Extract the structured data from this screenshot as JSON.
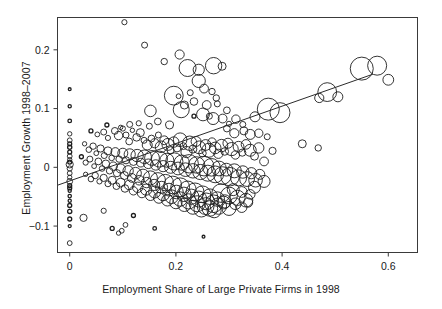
{
  "figure": {
    "background": "#ffffff",
    "ink": "#1a1a1a",
    "width": 442,
    "height": 309
  },
  "chart_data": {
    "type": "scatter",
    "title": "",
    "xlabel": "Employment Share of Large Private Firms in 1998",
    "ylabel": "Employment Growth 1998–2007",
    "marker": "open-circle",
    "marker_size_encodes": "weight",
    "grid": false,
    "legend": null,
    "xlim": [
      -0.023,
      0.655
    ],
    "ylim": [
      -0.145,
      0.255
    ],
    "xticks": [
      0,
      0.2,
      0.4,
      0.6
    ],
    "xtick_labels": [
      "0",
      "0.2",
      "0.4",
      "0.6"
    ],
    "yticks": [
      -0.1,
      0,
      0.1,
      0.2
    ],
    "ytick_labels": [
      "-0.1",
      "0",
      "0.1",
      "0.2"
    ],
    "fit_line": {
      "type": "linear",
      "x0": -0.023,
      "y0": -0.0305,
      "x1": 0.571,
      "y1": 0.1585,
      "slope": 0.318,
      "intercept": -0.0232
    },
    "points": [
      [
        0.0,
        0.104,
        1.6
      ],
      [
        0.0,
        0.079,
        1.8
      ],
      [
        0.0,
        0.057,
        2.2
      ],
      [
        0.0,
        0.046,
        2.4
      ],
      [
        0.0,
        0.04,
        2.0
      ],
      [
        0.0,
        0.034,
        2.1
      ],
      [
        0.0,
        0.026,
        2.0
      ],
      [
        0.0,
        0.019,
        2.4
      ],
      [
        0.0,
        0.013,
        2.2
      ],
      [
        0.0,
        0.005,
        3.6
      ],
      [
        0.0,
        -0.002,
        2.6
      ],
      [
        0.0,
        -0.01,
        2.4
      ],
      [
        0.0,
        -0.017,
        2.2
      ],
      [
        0.0,
        -0.024,
        2.9
      ],
      [
        0.0,
        -0.031,
        2.0
      ],
      [
        0.0,
        -0.04,
        1.6
      ],
      [
        0.0,
        -0.049,
        1.7
      ],
      [
        0.0,
        -0.057,
        1.6
      ],
      [
        0.0,
        -0.065,
        2.0
      ],
      [
        0.0,
        -0.075,
        2.1
      ],
      [
        0.0,
        -0.088,
        2.0
      ],
      [
        0.0,
        -0.1,
        1.5
      ],
      [
        0.0,
        -0.129,
        2.4
      ],
      [
        0.0,
        0.133,
        1.4
      ],
      [
        0.0,
        0.009,
        2.0
      ],
      [
        0.0,
        -0.035,
        2.0
      ],
      [
        0.103,
        0.247,
        2.6
      ],
      [
        0.141,
        0.208,
        3.0
      ],
      [
        0.178,
        0.18,
        3.2
      ],
      [
        0.207,
        0.192,
        4.6
      ],
      [
        0.222,
        0.169,
        8.5
      ],
      [
        0.243,
        0.166,
        5.6
      ],
      [
        0.271,
        0.173,
        8.2
      ],
      [
        0.287,
        0.172,
        4.0
      ],
      [
        0.243,
        0.147,
        6.6
      ],
      [
        0.253,
        0.134,
        4.4
      ],
      [
        0.268,
        0.129,
        3.2
      ],
      [
        0.276,
        0.118,
        3.2
      ],
      [
        0.278,
        0.108,
        3.0
      ],
      [
        0.227,
        0.127,
        3.0
      ],
      [
        0.196,
        0.122,
        9.4
      ],
      [
        0.205,
        0.121,
        2.4
      ],
      [
        0.152,
        0.096,
        5.8
      ],
      [
        0.21,
        0.098,
        8.0
      ],
      [
        0.234,
        0.087,
        2.0
      ],
      [
        0.251,
        0.09,
        6.4
      ],
      [
        0.263,
        0.087,
        3.0
      ],
      [
        0.27,
        0.083,
        6.0
      ],
      [
        0.288,
        0.083,
        4.4
      ],
      [
        0.296,
        0.097,
        3.4
      ],
      [
        0.3,
        0.074,
        2.6
      ],
      [
        0.313,
        0.082,
        4.2
      ],
      [
        0.326,
        0.073,
        3.0
      ],
      [
        0.349,
        0.086,
        5.0
      ],
      [
        0.374,
        0.099,
        11.0
      ],
      [
        0.396,
        0.093,
        10.0
      ],
      [
        0.47,
        0.118,
        4.6
      ],
      [
        0.485,
        0.128,
        9.4
      ],
      [
        0.505,
        0.12,
        5.0
      ],
      [
        0.55,
        0.168,
        11.5
      ],
      [
        0.579,
        0.173,
        9.5
      ],
      [
        0.6,
        0.149,
        5.4
      ],
      [
        0.438,
        0.04,
        4.0
      ],
      [
        0.468,
        0.033,
        3.2
      ],
      [
        0.04,
        0.062,
        2.0
      ],
      [
        0.052,
        0.056,
        2.4
      ],
      [
        0.064,
        0.06,
        3.0
      ],
      [
        0.072,
        0.05,
        2.6
      ],
      [
        0.085,
        0.062,
        3.4
      ],
      [
        0.092,
        0.054,
        4.2
      ],
      [
        0.1,
        0.066,
        2.6
      ],
      [
        0.106,
        0.055,
        3.0
      ],
      [
        0.112,
        0.044,
        3.4
      ],
      [
        0.118,
        0.063,
        2.2
      ],
      [
        0.126,
        0.051,
        3.8
      ],
      [
        0.133,
        0.059,
        4.0
      ],
      [
        0.14,
        0.046,
        3.0
      ],
      [
        0.146,
        0.038,
        5.0
      ],
      [
        0.154,
        0.049,
        3.4
      ],
      [
        0.16,
        0.041,
        4.6
      ],
      [
        0.167,
        0.055,
        3.0
      ],
      [
        0.172,
        0.035,
        5.8
      ],
      [
        0.178,
        0.046,
        4.4
      ],
      [
        0.185,
        0.039,
        6.0
      ],
      [
        0.19,
        0.029,
        3.6
      ],
      [
        0.196,
        0.043,
        5.2
      ],
      [
        0.202,
        0.033,
        4.0
      ],
      [
        0.208,
        0.047,
        6.8
      ],
      [
        0.214,
        0.036,
        3.4
      ],
      [
        0.22,
        0.026,
        5.6
      ],
      [
        0.226,
        0.041,
        7.2
      ],
      [
        0.232,
        0.031,
        4.0
      ],
      [
        0.238,
        0.044,
        5.0
      ],
      [
        0.244,
        0.034,
        6.4
      ],
      [
        0.25,
        0.024,
        3.8
      ],
      [
        0.256,
        0.038,
        5.4
      ],
      [
        0.262,
        0.029,
        7.0
      ],
      [
        0.268,
        0.043,
        4.2
      ],
      [
        0.274,
        0.033,
        5.8
      ],
      [
        0.28,
        0.023,
        4.6
      ],
      [
        0.286,
        0.037,
        6.2
      ],
      [
        0.292,
        0.027,
        3.8
      ],
      [
        0.298,
        0.041,
        5.0
      ],
      [
        0.305,
        0.031,
        6.6
      ],
      [
        0.312,
        0.021,
        4.2
      ],
      [
        0.318,
        0.035,
        5.4
      ],
      [
        0.325,
        0.025,
        3.6
      ],
      [
        0.332,
        0.039,
        4.8
      ],
      [
        0.34,
        0.029,
        6.0
      ],
      [
        0.348,
        0.019,
        4.0
      ],
      [
        0.356,
        0.033,
        5.2
      ],
      [
        0.028,
        0.04,
        2.2
      ],
      [
        0.036,
        0.03,
        2.8
      ],
      [
        0.044,
        0.036,
        3.2
      ],
      [
        0.05,
        0.024,
        2.4
      ],
      [
        0.058,
        0.032,
        3.6
      ],
      [
        0.065,
        0.02,
        3.0
      ],
      [
        0.072,
        0.028,
        4.0
      ],
      [
        0.079,
        0.016,
        2.8
      ],
      [
        0.086,
        0.026,
        4.4
      ],
      [
        0.093,
        0.014,
        3.2
      ],
      [
        0.1,
        0.024,
        5.0
      ],
      [
        0.106,
        0.012,
        3.6
      ],
      [
        0.113,
        0.022,
        5.6
      ],
      [
        0.12,
        0.01,
        4.0
      ],
      [
        0.127,
        0.02,
        6.2
      ],
      [
        0.134,
        0.008,
        4.4
      ],
      [
        0.141,
        0.018,
        6.8
      ],
      [
        0.148,
        0.006,
        4.8
      ],
      [
        0.155,
        0.016,
        7.4
      ],
      [
        0.162,
        0.004,
        5.2
      ],
      [
        0.169,
        0.014,
        8.0
      ],
      [
        0.176,
        0.002,
        5.6
      ],
      [
        0.183,
        0.012,
        7.0
      ],
      [
        0.19,
        0.0,
        6.0
      ],
      [
        0.197,
        0.01,
        8.6
      ],
      [
        0.204,
        -0.002,
        6.4
      ],
      [
        0.211,
        0.008,
        7.6
      ],
      [
        0.218,
        -0.004,
        6.8
      ],
      [
        0.225,
        0.006,
        9.2
      ],
      [
        0.232,
        -0.006,
        7.2
      ],
      [
        0.239,
        0.004,
        8.2
      ],
      [
        0.246,
        -0.008,
        7.6
      ],
      [
        0.253,
        0.002,
        9.8
      ],
      [
        0.26,
        -0.01,
        8.0
      ],
      [
        0.267,
        0.0,
        8.8
      ],
      [
        0.274,
        -0.012,
        8.4
      ],
      [
        0.281,
        -0.002,
        7.4
      ],
      [
        0.288,
        -0.014,
        8.8
      ],
      [
        0.295,
        -0.004,
        6.4
      ],
      [
        0.302,
        -0.016,
        9.2
      ],
      [
        0.31,
        -0.006,
        7.0
      ],
      [
        0.318,
        -0.018,
        8.0
      ],
      [
        0.326,
        -0.008,
        6.2
      ],
      [
        0.334,
        -0.02,
        7.4
      ],
      [
        0.342,
        -0.01,
        5.6
      ],
      [
        0.35,
        -0.022,
        6.8
      ],
      [
        0.358,
        -0.012,
        5.0
      ],
      [
        0.366,
        -0.024,
        6.0
      ],
      [
        0.022,
        0.018,
        2.0
      ],
      [
        0.03,
        0.008,
        2.6
      ],
      [
        0.038,
        0.014,
        3.0
      ],
      [
        0.046,
        0.002,
        2.4
      ],
      [
        0.054,
        0.01,
        3.4
      ],
      [
        0.061,
        -0.002,
        2.8
      ],
      [
        0.068,
        0.006,
        3.8
      ],
      [
        0.075,
        -0.006,
        3.2
      ],
      [
        0.082,
        0.002,
        4.2
      ],
      [
        0.089,
        -0.01,
        3.6
      ],
      [
        0.096,
        -0.002,
        4.6
      ],
      [
        0.103,
        -0.014,
        4.0
      ],
      [
        0.11,
        -0.006,
        5.2
      ],
      [
        0.117,
        -0.018,
        4.4
      ],
      [
        0.124,
        -0.01,
        5.8
      ],
      [
        0.131,
        -0.022,
        4.8
      ],
      [
        0.138,
        -0.014,
        6.4
      ],
      [
        0.145,
        -0.026,
        5.2
      ],
      [
        0.152,
        -0.018,
        7.0
      ],
      [
        0.159,
        -0.03,
        5.6
      ],
      [
        0.166,
        -0.022,
        7.6
      ],
      [
        0.173,
        -0.034,
        6.0
      ],
      [
        0.18,
        -0.026,
        8.2
      ],
      [
        0.187,
        -0.038,
        6.4
      ],
      [
        0.194,
        -0.03,
        8.8
      ],
      [
        0.201,
        -0.042,
        6.8
      ],
      [
        0.208,
        -0.034,
        9.4
      ],
      [
        0.215,
        -0.046,
        7.2
      ],
      [
        0.222,
        -0.038,
        8.6
      ],
      [
        0.229,
        -0.05,
        7.6
      ],
      [
        0.236,
        -0.042,
        9.0
      ],
      [
        0.243,
        -0.054,
        8.0
      ],
      [
        0.25,
        -0.046,
        8.4
      ],
      [
        0.257,
        -0.058,
        8.4
      ],
      [
        0.264,
        -0.05,
        7.8
      ],
      [
        0.271,
        -0.062,
        8.8
      ],
      [
        0.278,
        -0.054,
        7.2
      ],
      [
        0.285,
        -0.044,
        9.2
      ],
      [
        0.292,
        -0.058,
        6.6
      ],
      [
        0.3,
        -0.048,
        8.4
      ],
      [
        0.308,
        -0.038,
        6.0
      ],
      [
        0.316,
        -0.052,
        7.6
      ],
      [
        0.324,
        -0.042,
        5.4
      ],
      [
        0.332,
        -0.056,
        6.8
      ],
      [
        0.34,
        -0.046,
        4.8
      ],
      [
        0.348,
        -0.034,
        6.0
      ],
      [
        0.03,
        -0.012,
        2.2
      ],
      [
        0.04,
        -0.02,
        2.8
      ],
      [
        0.048,
        -0.014,
        3.2
      ],
      [
        0.056,
        -0.024,
        2.6
      ],
      [
        0.064,
        -0.018,
        3.6
      ],
      [
        0.072,
        -0.028,
        3.0
      ],
      [
        0.08,
        -0.022,
        4.0
      ],
      [
        0.088,
        -0.032,
        3.4
      ],
      [
        0.096,
        -0.026,
        4.4
      ],
      [
        0.104,
        -0.036,
        3.8
      ],
      [
        0.112,
        -0.03,
        4.8
      ],
      [
        0.12,
        -0.04,
        4.2
      ],
      [
        0.128,
        -0.034,
        5.2
      ],
      [
        0.136,
        -0.044,
        4.6
      ],
      [
        0.144,
        -0.038,
        5.6
      ],
      [
        0.152,
        -0.048,
        5.0
      ],
      [
        0.16,
        -0.042,
        6.0
      ],
      [
        0.168,
        -0.052,
        5.4
      ],
      [
        0.176,
        -0.046,
        6.4
      ],
      [
        0.184,
        -0.056,
        5.8
      ],
      [
        0.192,
        -0.05,
        6.8
      ],
      [
        0.2,
        -0.06,
        6.2
      ],
      [
        0.208,
        -0.054,
        7.2
      ],
      [
        0.216,
        -0.064,
        6.6
      ],
      [
        0.224,
        -0.058,
        7.6
      ],
      [
        0.232,
        -0.068,
        7.0
      ],
      [
        0.24,
        -0.062,
        8.0
      ],
      [
        0.248,
        -0.072,
        7.4
      ],
      [
        0.256,
        -0.066,
        8.4
      ],
      [
        0.264,
        -0.07,
        7.8
      ],
      [
        0.272,
        -0.074,
        7.0
      ],
      [
        0.28,
        -0.066,
        8.2
      ],
      [
        0.29,
        -0.06,
        6.4
      ],
      [
        0.3,
        -0.07,
        7.0
      ],
      [
        0.312,
        -0.062,
        5.8
      ],
      [
        0.324,
        -0.068,
        5.2
      ],
      [
        0.336,
        -0.06,
        4.6
      ],
      [
        0.026,
        -0.086,
        3.6
      ],
      [
        0.08,
        -0.104,
        2.0
      ],
      [
        0.092,
        -0.112,
        2.2
      ],
      [
        0.098,
        -0.108,
        2.4
      ],
      [
        0.105,
        -0.098,
        2.4
      ],
      [
        0.16,
        -0.104,
        1.8
      ],
      [
        0.252,
        -0.118,
        1.4
      ],
      [
        0.064,
        -0.074,
        2.6
      ],
      [
        0.12,
        -0.082,
        2.0
      ],
      [
        0.372,
        0.052,
        3.0
      ],
      [
        0.382,
        0.028,
        3.6
      ],
      [
        0.356,
        0.058,
        4.2
      ],
      [
        0.366,
        0.01,
        4.4
      ],
      [
        0.34,
        0.056,
        5.0
      ],
      [
        0.328,
        0.062,
        4.0
      ],
      [
        0.31,
        0.058,
        4.6
      ],
      [
        0.296,
        0.066,
        3.4
      ],
      [
        0.234,
        0.112,
        3.8
      ],
      [
        0.216,
        0.106,
        4.0
      ],
      [
        0.258,
        0.106,
        4.4
      ],
      [
        0.13,
        0.075,
        2.6
      ],
      [
        0.113,
        0.073,
        3.0
      ],
      [
        0.096,
        0.068,
        2.2
      ],
      [
        0.07,
        0.072,
        2.0
      ],
      [
        0.166,
        0.078,
        3.4
      ],
      [
        0.188,
        0.072,
        4.0
      ],
      [
        0.15,
        0.07,
        3.0
      ]
    ]
  }
}
